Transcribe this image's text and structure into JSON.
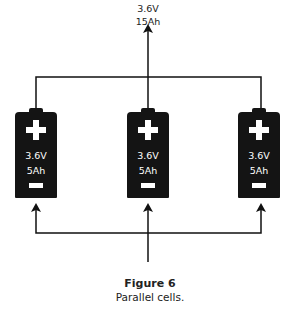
{
  "diagram": {
    "type": "parallel-battery-circuit",
    "output": {
      "voltage": "3.6V",
      "capacity": "15Ah"
    },
    "cells": [
      {
        "id": "cell-left",
        "positive": "+",
        "voltage": "3.6V",
        "capacity": "5Ah",
        "negative": "−"
      },
      {
        "id": "cell-center",
        "positive": "+",
        "voltage": "3.6V",
        "capacity": "5Ah",
        "negative": "−"
      },
      {
        "id": "cell-right",
        "positive": "+",
        "voltage": "3.6V",
        "capacity": "5Ah",
        "negative": "−"
      }
    ],
    "colors": {
      "cell_body": "#141414",
      "wire": "#111111",
      "text": "#222222"
    }
  },
  "caption": {
    "title": "Figure 6",
    "text": "Parallel cells."
  }
}
